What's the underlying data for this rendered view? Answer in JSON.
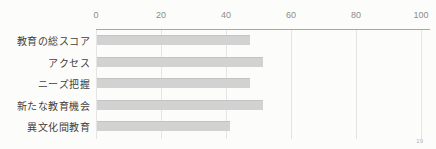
{
  "page_number": "19",
  "chart_data": {
    "type": "bar",
    "orientation": "horizontal",
    "title": "",
    "categories": [
      "教育の総スコア",
      "アクセス",
      "ニーズ把握",
      "新たな教育機会",
      "異文化間教育"
    ],
    "values": [
      47,
      51,
      47,
      51,
      41
    ],
    "xlim": [
      0,
      100
    ],
    "ticks": [
      0,
      20,
      40,
      60,
      80,
      100
    ],
    "grid": true,
    "legend": "none",
    "bar_color": "#d2d2d2",
    "axis_color": "#a6a6a6",
    "gridline_color": "#e5e5e5",
    "tick_label_color": "#8c8c8c",
    "category_label_color": "#3f3f3f",
    "background_color": "#fcfcfb"
  }
}
